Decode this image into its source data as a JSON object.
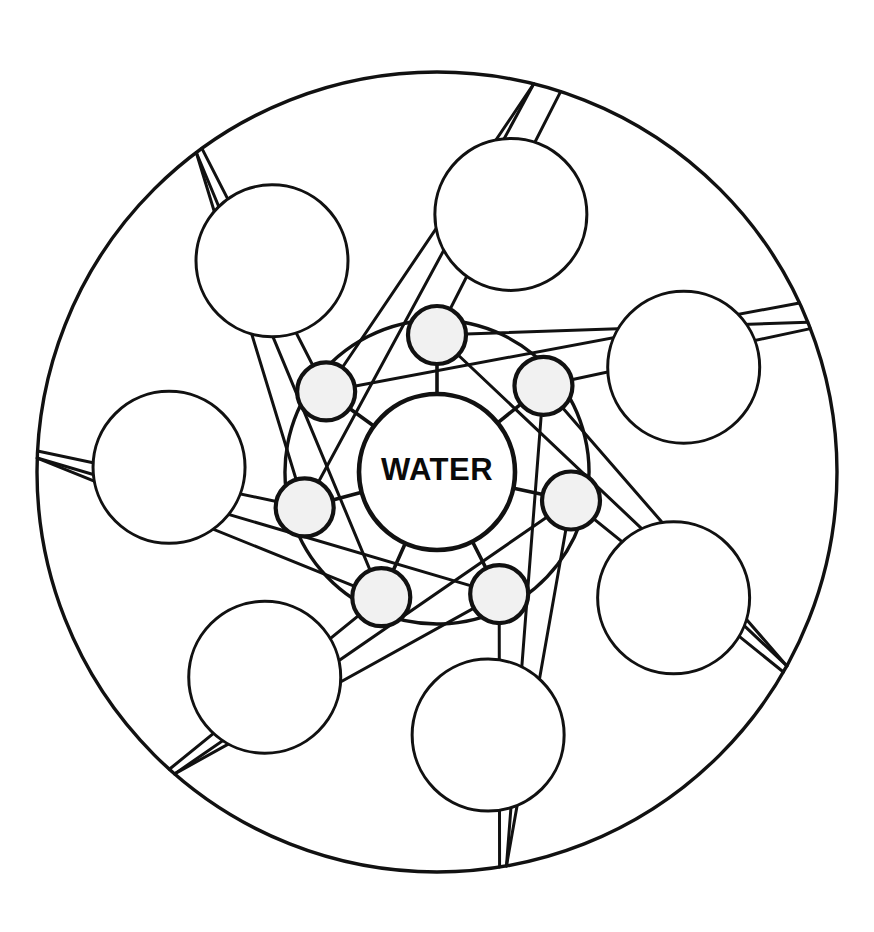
{
  "page": {
    "width": 874,
    "height": 932,
    "background_color": "#ffffff"
  },
  "figure": {
    "type": "mandala-diagram",
    "label": "seven-point water mandala",
    "center_label": "WATER",
    "stroke_color": "#111111",
    "fill_white": "#ffffff",
    "node_fill_color": "#f1f1f1",
    "symmetry": 7,
    "geometry": {
      "center": {
        "x": 437,
        "y": 472
      },
      "rim_radius": 400,
      "core_radius": 78,
      "node_radius": 29,
      "node_orbit_radius": 137,
      "inner_arc_radius": 152,
      "big_bubble_radius": 76,
      "big_bubble_orbit_radius": 268,
      "blade_tip_radius": 400,
      "blade_spread_degrees": 38,
      "rotation_offset_degrees": -90
    },
    "counts": {
      "rim_circles": 1,
      "node_circles": 7,
      "big_circles": 7,
      "blade_points": 7,
      "spokes": 7
    },
    "node_angles_degrees": [
      -90,
      -39,
      12,
      63,
      114,
      165,
      216
    ],
    "big_circle_angles_degrees": [
      -74,
      -23,
      28,
      79,
      130,
      181,
      232
    ],
    "blade_tip_angles_degrees": [
      -60,
      -9,
      42,
      93,
      144,
      195,
      246
    ]
  },
  "core": {
    "text": "WATER"
  }
}
